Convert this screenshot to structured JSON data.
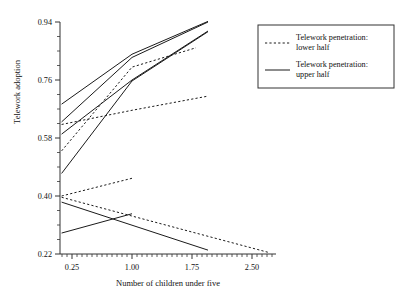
{
  "chart_data": {
    "type": "line",
    "title": "",
    "xlabel": "Number of children under five",
    "ylabel": "Telework adoption",
    "xlim": [
      0.1,
      2.8
    ],
    "ylim": [
      0.22,
      0.94
    ],
    "xticks": [
      "0.25",
      "1.00",
      "1.75",
      "2.50"
    ],
    "xtick_values": [
      0.25,
      1.0,
      1.75,
      2.5
    ],
    "yticks": [
      "0.22",
      "0.40",
      "0.58",
      "0.76",
      "0.94"
    ],
    "ytick_values": [
      0.22,
      0.4,
      0.58,
      0.76,
      0.94
    ],
    "grid": false,
    "legend_position": "right",
    "series": [
      {
        "name": "upper-solid-1",
        "style": "solid",
        "group": "upper half",
        "points": [
          [
            0.12,
            0.685
          ],
          [
            1.0,
            0.84
          ],
          [
            1.95,
            0.942
          ]
        ]
      },
      {
        "name": "upper-solid-2",
        "style": "solid",
        "group": "upper half",
        "points": [
          [
            0.12,
            0.63
          ],
          [
            1.0,
            0.83
          ],
          [
            1.95,
            0.94
          ]
        ]
      },
      {
        "name": "upper-solid-3",
        "style": "solid",
        "group": "upper half",
        "points": [
          [
            0.12,
            0.592
          ],
          [
            1.0,
            0.76
          ],
          [
            1.95,
            0.912
          ]
        ]
      },
      {
        "name": "upper-solid-4",
        "style": "solid",
        "group": "upper half",
        "points": [
          [
            0.12,
            0.47
          ],
          [
            1.0,
            0.757
          ],
          [
            1.95,
            0.91
          ]
        ]
      },
      {
        "name": "lower-dashed-1",
        "style": "dashed",
        "group": "lower half",
        "points": [
          [
            0.12,
            0.622
          ],
          [
            1.0,
            0.666
          ],
          [
            1.95,
            0.71
          ]
        ]
      },
      {
        "name": "lower-dashed-2",
        "style": "dashed",
        "group": "lower half",
        "points": [
          [
            0.12,
            0.54
          ],
          [
            1.0,
            0.8
          ],
          [
            1.8,
            0.86
          ]
        ]
      },
      {
        "name": "lower-dashed-3",
        "style": "dashed",
        "group": "lower half",
        "points": [
          [
            0.12,
            0.4
          ],
          [
            1.0,
            0.455
          ]
        ]
      },
      {
        "name": "lower-dashed-4",
        "style": "dashed",
        "group": "lower half",
        "points": [
          [
            0.12,
            0.396
          ],
          [
            2.72,
            0.224
          ]
        ]
      },
      {
        "name": "upper-solid-5",
        "style": "solid",
        "group": "upper half",
        "points": [
          [
            0.12,
            0.381
          ],
          [
            1.95,
            0.232
          ]
        ]
      },
      {
        "name": "upper-solid-6",
        "style": "solid",
        "group": "upper half",
        "points": [
          [
            0.12,
            0.285
          ],
          [
            1.0,
            0.345
          ]
        ]
      }
    ]
  },
  "legend": {
    "entries": [
      {
        "label_line1": "Telework penetration:",
        "label_line2": "lower half",
        "style": "dashed"
      },
      {
        "label_line1": "Telework penetration:",
        "label_line2": "upper half",
        "style": "solid"
      }
    ]
  },
  "colors": {
    "ink": "#1a1a1a",
    "axis": "#333333",
    "background": "#ffffff"
  }
}
